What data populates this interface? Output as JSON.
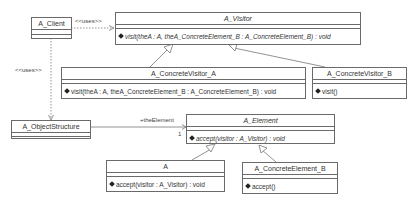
{
  "diagram": {
    "type": "UML class diagram",
    "classes": {
      "client": {
        "name": "A_Client"
      },
      "visitor": {
        "name": "A_Visitor",
        "abstract": true,
        "operation": "visit(theA : A, theA_ConcreteElement_B : A_ConcreteElement_B) : void"
      },
      "concrete_visitor_a": {
        "name": "A_ConcreteVisitor_A",
        "operation": "visit(theA : A, theA_ConcreteElement_B : A_ConcreteElement_B) : void"
      },
      "concrete_visitor_b": {
        "name": "A_ConcreteVisitor_B",
        "operation": "visit()"
      },
      "object_structure": {
        "name": "A_ObjectStructure"
      },
      "element": {
        "name": "A_Element",
        "abstract": true,
        "operation": "accept(visitor : A_Visitor) : void"
      },
      "a": {
        "name": "A",
        "operation": "accept(visitor : A_Visitor) : void"
      },
      "concrete_element_b": {
        "name": "A_ConcreteElement_B",
        "operation": "accept()"
      }
    },
    "relations": {
      "client_uses_visitor": {
        "stereotype": "<<uses>>"
      },
      "client_uses_object_structure": {
        "stereotype": "<<uses>>"
      },
      "object_structure_element": {
        "role": "+theElement",
        "multiplicity": "1"
      }
    }
  }
}
